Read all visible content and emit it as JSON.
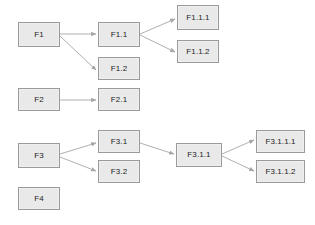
{
  "diagram": {
    "type": "flowchart",
    "background_color": "#ffffff",
    "node_fill_color": "#e9e9e9",
    "node_border_color": "#9a9a9a",
    "edge_color": "#a6a6a6",
    "text_color": "#1d1d1d",
    "nodes": [
      {
        "id": "F1",
        "label": "F1",
        "x": 18,
        "y": 22,
        "w": 42,
        "h": 25
      },
      {
        "id": "F1.1",
        "label": "F1.1",
        "x": 98,
        "y": 22,
        "w": 42,
        "h": 25
      },
      {
        "id": "F1.2",
        "label": "F1.2",
        "x": 98,
        "y": 57,
        "w": 42,
        "h": 23
      },
      {
        "id": "F1.1.1",
        "label": "F1.1.1",
        "x": 177,
        "y": 5,
        "w": 42,
        "h": 25
      },
      {
        "id": "F1.1.2",
        "label": "F1.1.2",
        "x": 177,
        "y": 40,
        "w": 42,
        "h": 23
      },
      {
        "id": "F2",
        "label": "F2",
        "x": 18,
        "y": 88,
        "w": 42,
        "h": 23
      },
      {
        "id": "F2.1",
        "label": "F2.1",
        "x": 98,
        "y": 88,
        "w": 42,
        "h": 23
      },
      {
        "id": "F3",
        "label": "F3",
        "x": 18,
        "y": 143,
        "w": 42,
        "h": 25
      },
      {
        "id": "F3.1",
        "label": "F3.1",
        "x": 98,
        "y": 130,
        "w": 42,
        "h": 23
      },
      {
        "id": "F3.2",
        "label": "F3.2",
        "x": 98,
        "y": 160,
        "w": 42,
        "h": 23
      },
      {
        "id": "F3.1.1",
        "label": "F3.1.1",
        "x": 176,
        "y": 143,
        "w": 46,
        "h": 24
      },
      {
        "id": "F3.1.1.1",
        "label": "F3.1.1.1",
        "x": 256,
        "y": 130,
        "w": 49,
        "h": 23
      },
      {
        "id": "F3.1.1.2",
        "label": "F3.1.1.2",
        "x": 256,
        "y": 160,
        "w": 49,
        "h": 23
      },
      {
        "id": "F4",
        "label": "F4",
        "x": 18,
        "y": 187,
        "w": 42,
        "h": 23
      }
    ],
    "edges": [
      {
        "from": "F1",
        "to": "F1.1",
        "x1": 60,
        "y1": 34,
        "x2": 96,
        "y2": 34
      },
      {
        "from": "F1",
        "to": "F1.2",
        "x1": 60,
        "y1": 36,
        "x2": 96,
        "y2": 70
      },
      {
        "from": "F1.1",
        "to": "F1.1.1",
        "x1": 140,
        "y1": 34,
        "x2": 175,
        "y2": 19
      },
      {
        "from": "F1.1",
        "to": "F1.1.2",
        "x1": 140,
        "y1": 35,
        "x2": 175,
        "y2": 52
      },
      {
        "from": "F2",
        "to": "F2.1",
        "x1": 60,
        "y1": 100,
        "x2": 96,
        "y2": 100
      },
      {
        "from": "F3",
        "to": "F3.1",
        "x1": 60,
        "y1": 154,
        "x2": 96,
        "y2": 143
      },
      {
        "from": "F3",
        "to": "F3.2",
        "x1": 60,
        "y1": 157,
        "x2": 96,
        "y2": 171
      },
      {
        "from": "F3.1",
        "to": "F3.1.1",
        "x1": 140,
        "y1": 143,
        "x2": 174,
        "y2": 154
      },
      {
        "from": "F3.1.1",
        "to": "F3.1.1.1",
        "x1": 222,
        "y1": 154,
        "x2": 254,
        "y2": 140
      },
      {
        "from": "F3.1.1",
        "to": "F3.1.1.2",
        "x1": 222,
        "y1": 156,
        "x2": 254,
        "y2": 171
      }
    ]
  }
}
